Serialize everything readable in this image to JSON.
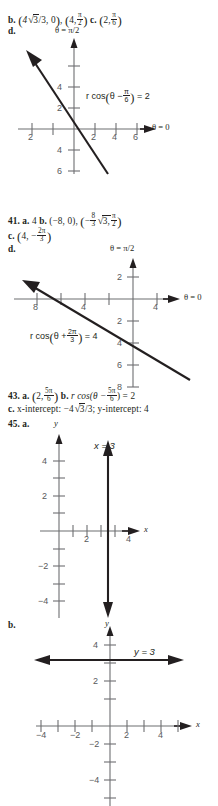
{
  "page": {
    "answers": [
      {
        "id": "ans-39",
        "parts": [
          {
            "label": "b.",
            "value": "(4√3/3, 0), (4, π/2)"
          },
          {
            "label": "c.",
            "value": "(2, π/6)"
          },
          {
            "label": "d.",
            "value": "graph"
          }
        ]
      },
      {
        "id": "ans-41",
        "number": "41.",
        "parts": [
          {
            "label": "a.",
            "value": "4"
          },
          {
            "label": "b.",
            "value": "(-8, 0), (-8/3 √3, π/2)"
          },
          {
            "label": "c.",
            "value": "(4, -2π/3)"
          },
          {
            "label": "d.",
            "value": "graph"
          }
        ]
      },
      {
        "id": "ans-43",
        "number": "43.",
        "parts": [
          {
            "label": "a.",
            "value": "(2, 5π/6)"
          },
          {
            "label": "b.",
            "value": "r cos(θ - 5π/6) = 2"
          },
          {
            "label": "c.",
            "value": "x-intercept: -4√3/3; y-intercept: 4"
          }
        ]
      },
      {
        "id": "ans-45",
        "number": "45.",
        "parts": [
          {
            "label": "a.",
            "value": "graph x = 3"
          },
          {
            "label": "b.",
            "value": "graph y = 3"
          }
        ]
      }
    ],
    "text": {
      "b_label": "b.",
      "c_label": "c.",
      "d_label": "d.",
      "a_label": "a.",
      "num_41": "41.",
      "num_43": "43.",
      "num_45": "45.",
      "val_39b_1_coef": "4",
      "val_39b_1_rad": "3",
      "val_39b_1_den": "/3,",
      "val_39b_1_zero": "0",
      "val_39b_2_x": "4,",
      "val_39b_2_num": "π",
      "val_39b_2_den": "2",
      "val_39c_x": "2,",
      "val_39c_num": "π",
      "val_39c_den": "6",
      "val_41a": "4",
      "val_41b_1": "(−8, 0),",
      "val_41b_2_num": "8",
      "val_41b_2_den": "3",
      "val_41b_2_rad": "3,",
      "val_41b_2_angnum": "π",
      "val_41b_2_angden": "2",
      "val_41c_x": "4, −",
      "val_41c_num": "2π",
      "val_41c_den": "3",
      "val_43a_x": "2,",
      "val_43a_num": "5π",
      "val_43a_den": "6",
      "val_43b_pre": "r cos(θ −",
      "val_43b_num": "5π",
      "val_43b_den": "6",
      "val_43b_post": ") = 2",
      "val_43c_pre": "x-intercept:",
      "val_43c_coef": "−4",
      "val_43c_rad": "3",
      "val_43c_den": "/3;",
      "val_43c_post": "y-intercept: 4"
    },
    "graphs": [
      {
        "id": "graph-39d",
        "theta_vertical": "θ = π/2",
        "theta_horizontal": "θ = 0",
        "equation_pre": "r cos",
        "equation_theta": "θ −",
        "equation_num": "π",
        "equation_den": "6",
        "equation_post": "= 2",
        "x_ticks": [
          "2",
          "2",
          "4",
          "6"
        ],
        "y_ticks": [
          "4",
          "2",
          "4",
          "6"
        ],
        "line": "r cos(theta - pi/6) = 2"
      },
      {
        "id": "graph-41d",
        "theta_vertical": "θ = π/2",
        "theta_horizontal": "θ = 0",
        "equation_pre": "r cos",
        "equation_theta": "θ +",
        "equation_num": "2π",
        "equation_den": "3",
        "equation_post": "= 4",
        "x_ticks": [
          "8",
          "4",
          "4"
        ],
        "y_ticks": [
          "2",
          "2",
          "4",
          "6",
          "8"
        ],
        "line": "r cos(theta + 2pi/3) = 4"
      },
      {
        "id": "graph-45a",
        "y_axis_label": "y",
        "x_axis_label": "x",
        "equation": "x = 3",
        "x_ticks": [
          "2",
          "4"
        ],
        "y_ticks": [
          "4",
          "2",
          "−2",
          "−4"
        ]
      },
      {
        "id": "graph-45b",
        "y_axis_label": "y",
        "x_axis_label": "x",
        "equation": "y = 3",
        "x_ticks": [
          "−4",
          "−2",
          "2",
          "4"
        ],
        "y_ticks": [
          "4",
          "2",
          "−2",
          "−4"
        ]
      }
    ]
  }
}
